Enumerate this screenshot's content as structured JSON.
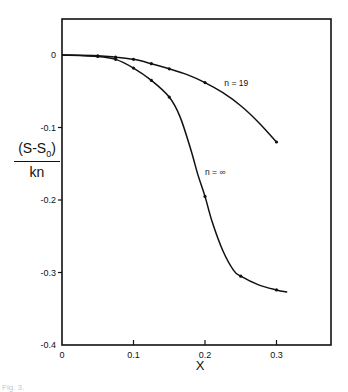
{
  "chart_data": {
    "type": "line",
    "title": "",
    "xlabel": "X",
    "ylabel": "(S-S0)/kn",
    "ylabel_parts": {
      "numerator_prefix": "(S-S",
      "numerator_sub": "0",
      "numerator_suffix": ")",
      "denominator": "kn"
    },
    "xlim": [
      0,
      0.38
    ],
    "ylim": [
      -0.4,
      0.05
    ],
    "grid": false,
    "legend": "none (inline curve annotations)",
    "x_ticks": [
      0,
      0.1,
      0.2,
      0.3
    ],
    "x_tick_labels": [
      "0",
      "0.1",
      "0.2",
      "0.3"
    ],
    "y_ticks": [
      0,
      -0.1,
      -0.2,
      -0.3,
      -0.4
    ],
    "y_tick_labels": [
      "0",
      "-0.1",
      "-0.2",
      "-0.3",
      "-0.4"
    ],
    "series": [
      {
        "name": "n = 19",
        "label": "n = 19",
        "label_pos": [
          0.227,
          -0.038
        ],
        "markers": [
          [
            0.05,
            -0.001
          ],
          [
            0.075,
            -0.003
          ],
          [
            0.1,
            -0.006
          ],
          [
            0.125,
            -0.012
          ],
          [
            0.15,
            -0.019
          ],
          [
            0.2,
            -0.038
          ],
          [
            0.3,
            -0.12
          ]
        ],
        "curve": [
          [
            0,
            0
          ],
          [
            0.05,
            -0.001
          ],
          [
            0.075,
            -0.003
          ],
          [
            0.1,
            -0.006
          ],
          [
            0.125,
            -0.012
          ],
          [
            0.15,
            -0.019
          ],
          [
            0.175,
            -0.027
          ],
          [
            0.2,
            -0.038
          ],
          [
            0.225,
            -0.052
          ],
          [
            0.25,
            -0.07
          ],
          [
            0.275,
            -0.093
          ],
          [
            0.3,
            -0.12
          ]
        ]
      },
      {
        "name": "n = ∞",
        "label": "n = ∞",
        "label_pos": [
          0.2,
          -0.162
        ],
        "markers": [
          [
            0.05,
            -0.002
          ],
          [
            0.075,
            -0.006
          ],
          [
            0.1,
            -0.018
          ],
          [
            0.125,
            -0.035
          ],
          [
            0.15,
            -0.058
          ],
          [
            0.2,
            -0.195
          ],
          [
            0.25,
            -0.305
          ],
          [
            0.3,
            -0.324
          ]
        ],
        "curve": [
          [
            0,
            0
          ],
          [
            0.05,
            -0.002
          ],
          [
            0.075,
            -0.006
          ],
          [
            0.1,
            -0.018
          ],
          [
            0.125,
            -0.035
          ],
          [
            0.15,
            -0.058
          ],
          [
            0.165,
            -0.085
          ],
          [
            0.18,
            -0.13
          ],
          [
            0.19,
            -0.165
          ],
          [
            0.2,
            -0.195
          ],
          [
            0.21,
            -0.23
          ],
          [
            0.225,
            -0.27
          ],
          [
            0.24,
            -0.297
          ],
          [
            0.25,
            -0.305
          ],
          [
            0.275,
            -0.317
          ],
          [
            0.3,
            -0.324
          ],
          [
            0.315,
            -0.327
          ]
        ]
      }
    ]
  },
  "caption": "Fig. 3."
}
